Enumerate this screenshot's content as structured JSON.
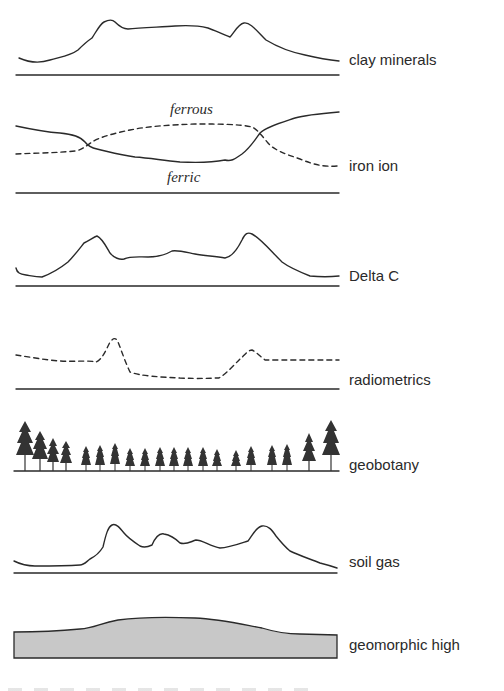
{
  "diagram": {
    "title": "",
    "panels": [
      {
        "id": "clay",
        "label": "clay minerals",
        "style": "solid"
      },
      {
        "id": "iron",
        "label": "iron ion",
        "style": "solid+dashed",
        "annotations": {
          "upper": "ferrous",
          "lower": "ferric"
        }
      },
      {
        "id": "deltac",
        "label": "Delta C",
        "style": "solid"
      },
      {
        "id": "radio",
        "label": "radiometrics",
        "style": "dashed"
      },
      {
        "id": "geobot",
        "label": "geobotany",
        "style": "trees"
      },
      {
        "id": "soilgas",
        "label": "soil gas",
        "style": "solid"
      },
      {
        "id": "geomorph",
        "label": "geomorphic high",
        "style": "filled"
      }
    ],
    "colors": {
      "ink": "#2a2a2a",
      "fill": "#c8c8c8",
      "background": "#ffffff"
    }
  }
}
